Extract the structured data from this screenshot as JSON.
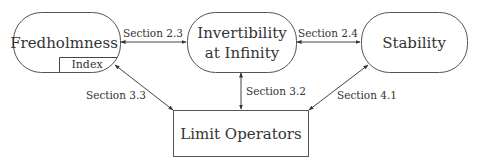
{
  "nodes": {
    "fredholmness": {
      "label": "Fredholmness",
      "sub_label": "Index"
    },
    "invertibility": {
      "line1": "Invertibility",
      "line2": "at Infinity"
    },
    "stability": {
      "label": "Stability"
    },
    "limit_operators": {
      "label": "Limit Operators"
    }
  },
  "edges": {
    "fredholm_invertibility": {
      "label": "Section 2.3"
    },
    "invertibility_stability": {
      "label": "Section 2.4"
    },
    "fredholm_limit": {
      "label": "Section 3.3"
    },
    "invertibility_limit": {
      "label": "Section 3.2"
    },
    "stability_limit": {
      "label": "Section 4.1"
    }
  },
  "colors": {
    "stroke": "#555555",
    "text": "#333333",
    "background": "#ffffff"
  }
}
